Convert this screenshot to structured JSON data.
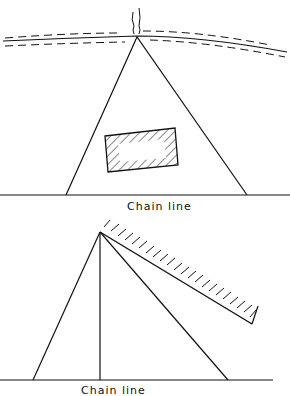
{
  "figure": {
    "top_diagram": {
      "label": "Chain line",
      "elements": [
        "river-bank",
        "survey-pole",
        "triangle-offsets",
        "hatched-building"
      ]
    },
    "bottom_diagram": {
      "label": "Chain line",
      "elements": [
        "triangle-offsets",
        "perpendicular-offset",
        "hatched-wall"
      ]
    },
    "colors": {
      "ink": "#111111",
      "background": "#ffffff"
    }
  }
}
